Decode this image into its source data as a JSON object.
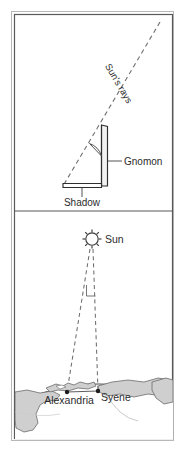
{
  "figure": {
    "panels": [
      {
        "name": "gnomon-panel",
        "labels": {
          "sun_rays": "Sun's rays",
          "gnomon": "Gnomon",
          "shadow": "Shadow"
        }
      },
      {
        "name": "earth-panel",
        "labels": {
          "sun": "Sun",
          "alexandria": "Alexandria",
          "syene": "Syene"
        }
      }
    ],
    "icons": {
      "sun": "sun-icon",
      "city_marker": "city-dot-marker",
      "angle_arc": "angle-arc-icon",
      "right_angle": "angle-marker-icon"
    },
    "colors": {
      "frame_outer": "#b8b8b8",
      "frame_inner": "#595959",
      "line": "#3a3a3a",
      "dashed": "#6e6e6e",
      "land_fill": "#cfcfcf",
      "land_stroke": "#6b6b6b",
      "text": "#2b2b2b",
      "background": "#ffffff",
      "gnomon_fill": "#f2f2f2"
    }
  }
}
